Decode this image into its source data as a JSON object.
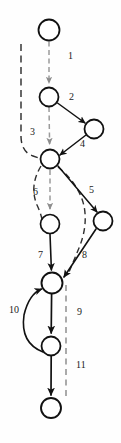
{
  "diagram": {
    "type": "directed-graph",
    "background_color": "#fefefe",
    "solid_edge_color": "#111111",
    "dashed_edge_color": "#9a9a9a",
    "node_fill": "#ffffff",
    "node_stroke": "#111111",
    "nodes": [
      {
        "id": "n1",
        "cx": 49,
        "cy": 30,
        "r": 10.5
      },
      {
        "id": "n2",
        "cx": 49,
        "cy": 97,
        "r": 9.5
      },
      {
        "id": "n3",
        "cx": 94,
        "cy": 129,
        "r": 9.5
      },
      {
        "id": "n4",
        "cx": 50,
        "cy": 159,
        "r": 9.5
      },
      {
        "id": "n5",
        "cx": 50,
        "cy": 224,
        "r": 9.5
      },
      {
        "id": "n6",
        "cx": 103,
        "cy": 221,
        "r": 9.5
      },
      {
        "id": "n7",
        "cx": 52,
        "cy": 283,
        "r": 10.5
      },
      {
        "id": "n8",
        "cx": 51,
        "cy": 346,
        "r": 9.5
      },
      {
        "id": "n9",
        "cx": 51,
        "cy": 408,
        "r": 10.0
      }
    ],
    "edge_labels": [
      {
        "id": "e1",
        "text": "1",
        "x": 68,
        "y": 56
      },
      {
        "id": "e2",
        "text": "2",
        "x": 69,
        "y": 97
      },
      {
        "id": "e3",
        "text": "3",
        "x": 30,
        "y": 132
      },
      {
        "id": "e4",
        "text": "4",
        "x": 80,
        "y": 144
      },
      {
        "id": "e5",
        "text": "5",
        "x": 89,
        "y": 190
      },
      {
        "id": "e6",
        "text": "6",
        "x": 33,
        "y": 192
      },
      {
        "id": "e7",
        "text": "7",
        "x": 38,
        "y": 255
      },
      {
        "id": "e8",
        "text": "8",
        "x": 82,
        "y": 255
      },
      {
        "id": "e9",
        "text": "9",
        "x": 77,
        "y": 312
      },
      {
        "id": "e10",
        "text": "10",
        "x": 9,
        "y": 310
      },
      {
        "id": "e11",
        "text": "11",
        "x": 76,
        "y": 365
      }
    ]
  }
}
